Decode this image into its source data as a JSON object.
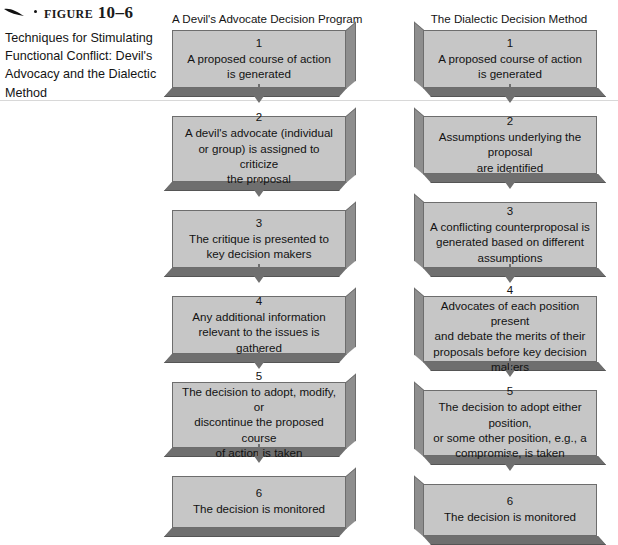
{
  "figure": {
    "label": "Figure 10–6",
    "caption": "Techniques for Stimulating Functional Conflict: Devil's Advocacy and the Dialectic Method",
    "icons": {
      "swoosh": "swoosh-mark",
      "dot": "bullet-dot"
    }
  },
  "colors": {
    "box_fill": "#c6c6c6",
    "box_border": "#6d6d6d",
    "extrude_side": "#8e8e8e",
    "extrude_bottom": "#6f6f6f",
    "arrow": "#6f6f6f",
    "rule": "#d8d8d8",
    "text": "#121212",
    "page_background": "#ffffff"
  },
  "columns": [
    {
      "id": "devils-advocate",
      "title": "A Devil's Advocate Decision Program",
      "extrusion": "right",
      "steps": [
        {
          "number": "1",
          "text": "A proposed course of action\nis generated"
        },
        {
          "number": "2",
          "text": "A devil's advocate (individual\nor group) is assigned to criticize\nthe proposal"
        },
        {
          "number": "3",
          "text": "The critique is presented to\nkey decision makers"
        },
        {
          "number": "4",
          "text": "Any additional information\nrelevant to the issues is gathered"
        },
        {
          "number": "5",
          "text": "The decision to adopt, modify, or\ndiscontinue the proposed course\nof action is taken"
        },
        {
          "number": "6",
          "text": "The decision is monitored"
        }
      ]
    },
    {
      "id": "dialectic-method",
      "title": "The Dialectic Decision Method",
      "extrusion": "left",
      "steps": [
        {
          "number": "1",
          "text": "A proposed course of action\nis generated"
        },
        {
          "number": "2",
          "text": "Assumptions underlying the proposal\nare identified"
        },
        {
          "number": "3",
          "text": "A conflicting counterproposal is\ngenerated based on different\nassumptions"
        },
        {
          "number": "4",
          "text": "Advocates of each position present\nand debate the merits of their\nproposals before key decision makers"
        },
        {
          "number": "5",
          "text": "The decision to adopt either position,\nor some other position, e.g., a\ncompromise, is taken"
        },
        {
          "number": "6",
          "text": "The decision is monitored"
        }
      ]
    }
  ]
}
